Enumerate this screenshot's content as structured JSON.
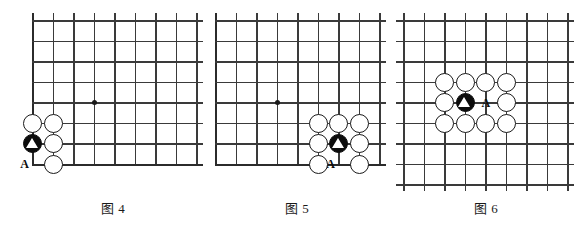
{
  "page": {
    "kind": "go-problem-diagrams",
    "background_color": "#ffffff",
    "line_color": "#3a3a3a",
    "stone_black_color": "#0c0c0c",
    "stone_white_color": "#ffffff",
    "label_color": "#0c0c0c"
  },
  "diagrams": [
    {
      "id": "diagram-4",
      "caption": "图 4",
      "caption_prefix": "图",
      "caption_number": "4",
      "board": {
        "type": "corner",
        "cols": 9,
        "rows": 8,
        "left_edge": true,
        "bottom_edge": true,
        "top_edge": false,
        "right_edge": false,
        "star_points": [
          {
            "col": 4,
            "row": 5
          }
        ]
      },
      "stones": [
        {
          "color": "white",
          "col": 1,
          "row": 6
        },
        {
          "color": "white",
          "col": 2,
          "row": 6
        },
        {
          "color": "black",
          "col": 1,
          "row": 7,
          "mark": "triangle"
        },
        {
          "color": "white",
          "col": 2,
          "row": 7
        },
        {
          "color": "white",
          "col": 2,
          "row": 8
        }
      ],
      "labels": [
        {
          "text": "A",
          "col": 1,
          "row": 8,
          "tick": "right"
        }
      ]
    },
    {
      "id": "diagram-5",
      "caption": "图 5",
      "caption_prefix": "图",
      "caption_number": "5",
      "board": {
        "type": "corner",
        "cols": 9,
        "rows": 8,
        "left_edge": true,
        "bottom_edge": true,
        "top_edge": false,
        "right_edge": false,
        "star_points": [
          {
            "col": 4,
            "row": 5
          }
        ]
      },
      "stones": [
        {
          "color": "white",
          "col": 6,
          "row": 6
        },
        {
          "color": "white",
          "col": 7,
          "row": 6
        },
        {
          "color": "white",
          "col": 8,
          "row": 6
        },
        {
          "color": "white",
          "col": 6,
          "row": 7
        },
        {
          "color": "black",
          "col": 7,
          "row": 7,
          "mark": "triangle"
        },
        {
          "color": "white",
          "col": 8,
          "row": 7
        },
        {
          "color": "white",
          "col": 6,
          "row": 8
        },
        {
          "color": "white",
          "col": 8,
          "row": 8
        }
      ],
      "labels": [
        {
          "text": "A",
          "col": 7,
          "row": 8,
          "tick": "both"
        }
      ]
    },
    {
      "id": "diagram-6",
      "caption": "图 6",
      "caption_prefix": "图",
      "caption_number": "6",
      "board": {
        "type": "center",
        "cols": 9,
        "rows": 9,
        "left_edge": false,
        "bottom_edge": false,
        "top_edge": false,
        "right_edge": false,
        "star_points": []
      },
      "stones": [
        {
          "color": "white",
          "col": 3,
          "row": 4
        },
        {
          "color": "white",
          "col": 4,
          "row": 4
        },
        {
          "color": "white",
          "col": 5,
          "row": 4
        },
        {
          "color": "white",
          "col": 6,
          "row": 4
        },
        {
          "color": "white",
          "col": 3,
          "row": 5
        },
        {
          "color": "black",
          "col": 4,
          "row": 5,
          "mark": "triangle"
        },
        {
          "color": "white",
          "col": 6,
          "row": 5
        },
        {
          "color": "white",
          "col": 3,
          "row": 6
        },
        {
          "color": "white",
          "col": 4,
          "row": 6
        },
        {
          "color": "white",
          "col": 5,
          "row": 6
        },
        {
          "color": "white",
          "col": 6,
          "row": 6
        }
      ],
      "labels": [
        {
          "text": "A",
          "col": 5,
          "row": 5,
          "tick": "none"
        }
      ]
    }
  ]
}
